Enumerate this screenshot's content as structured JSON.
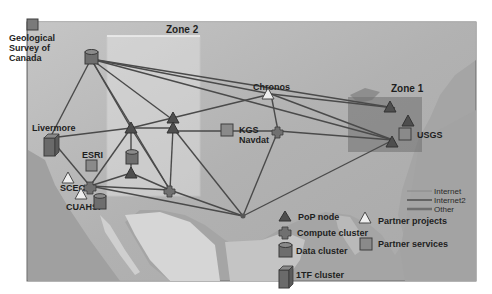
{
  "figure": {
    "type": "network-map"
  },
  "zones": [
    {
      "id": "zone1",
      "label": "Zone 1"
    },
    {
      "id": "zone2",
      "label": "Zone 2"
    }
  ],
  "sites": {
    "geological_survey": {
      "label_line1": "Geological",
      "label_line2": "Survey of",
      "label_line3": "Canada",
      "type": "partner-service"
    },
    "livermore": {
      "label": "Livermore",
      "type": "1tf-cluster"
    },
    "esri": {
      "label": "ESRI",
      "type": "partner-service"
    },
    "scec": {
      "label": "SCEC",
      "type": "compute-cluster"
    },
    "cuahsi": {
      "label": "CUAHSI",
      "type": "partner-project"
    },
    "chronos": {
      "label": "Chronos",
      "type": "partner-project"
    },
    "kgs_navdat": {
      "label_line1": "KGS",
      "label_line2": "Navdat",
      "type": "partner-service"
    },
    "usgs": {
      "label": "USGS",
      "type": "partner-service"
    }
  },
  "legend": {
    "lines": [
      {
        "label": "Internet",
        "color": "#8a8a8a"
      },
      {
        "label": "Internet2",
        "color": "#5c5c5c"
      },
      {
        "label": "Other",
        "color": "#6e6e6e"
      }
    ],
    "symbols": [
      {
        "label": "PoP node",
        "icon": "triangle-dark-icon"
      },
      {
        "label": "Compute cluster",
        "icon": "cross-compute-icon"
      },
      {
        "label": "Data cluster",
        "icon": "cylinder-icon"
      },
      {
        "label": "1TF cluster",
        "icon": "box-3d-icon"
      },
      {
        "label": "Partner projects",
        "icon": "triangle-light-icon"
      },
      {
        "label": "Partner services",
        "icon": "square-icon"
      }
    ]
  },
  "colors": {
    "land": "#b8b8b8",
    "water": "#9c9c9c",
    "zone_fill": "#6f6f6f",
    "link": "#4a4a4a",
    "node": "#555555"
  }
}
